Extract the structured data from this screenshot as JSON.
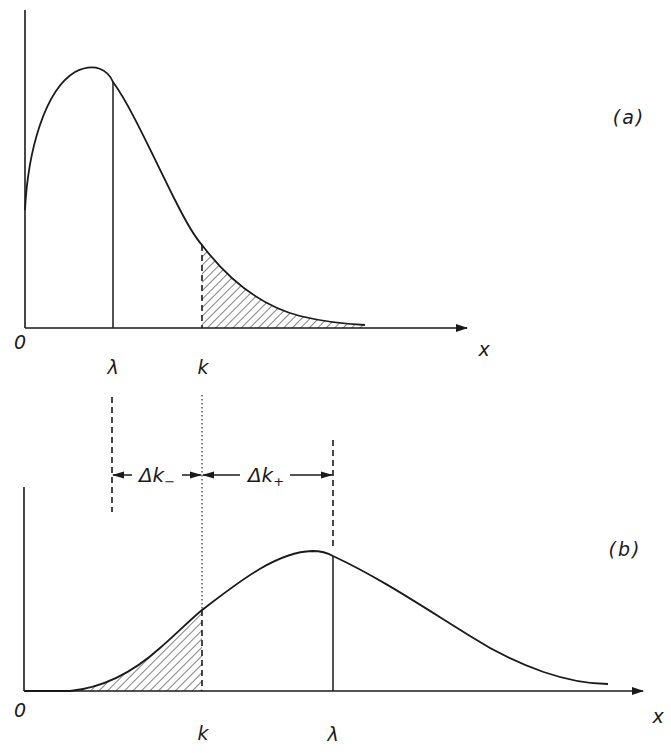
{
  "figure": {
    "panel_a": {
      "label": "(a)",
      "origin_label": "0",
      "x_axis_label": "x",
      "markers": [
        {
          "symbol": "λ",
          "style": "solid",
          "description": "mean λ, left of peak tail"
        },
        {
          "symbol": "k",
          "style": "dashed",
          "description": "threshold k, upper tail shaded"
        }
      ],
      "shaded_region": "x > k (upper tail)"
    },
    "panel_b": {
      "label": "(b)",
      "origin_label": "0",
      "x_axis_label": "x",
      "markers": [
        {
          "symbol": "k",
          "style": "dashed",
          "description": "threshold k, lower tail shaded"
        },
        {
          "symbol": "λ",
          "style": "solid",
          "description": "mean λ"
        }
      ],
      "shaded_region": "x < k (lower tail)"
    },
    "intervals": {
      "delta_minus": {
        "symbol": "Δk",
        "subscript": "−"
      },
      "delta_plus": {
        "symbol": "Δk",
        "subscript": "+"
      }
    },
    "colors": {
      "ink": "#1a1a1a",
      "background": "#ffffff"
    }
  }
}
